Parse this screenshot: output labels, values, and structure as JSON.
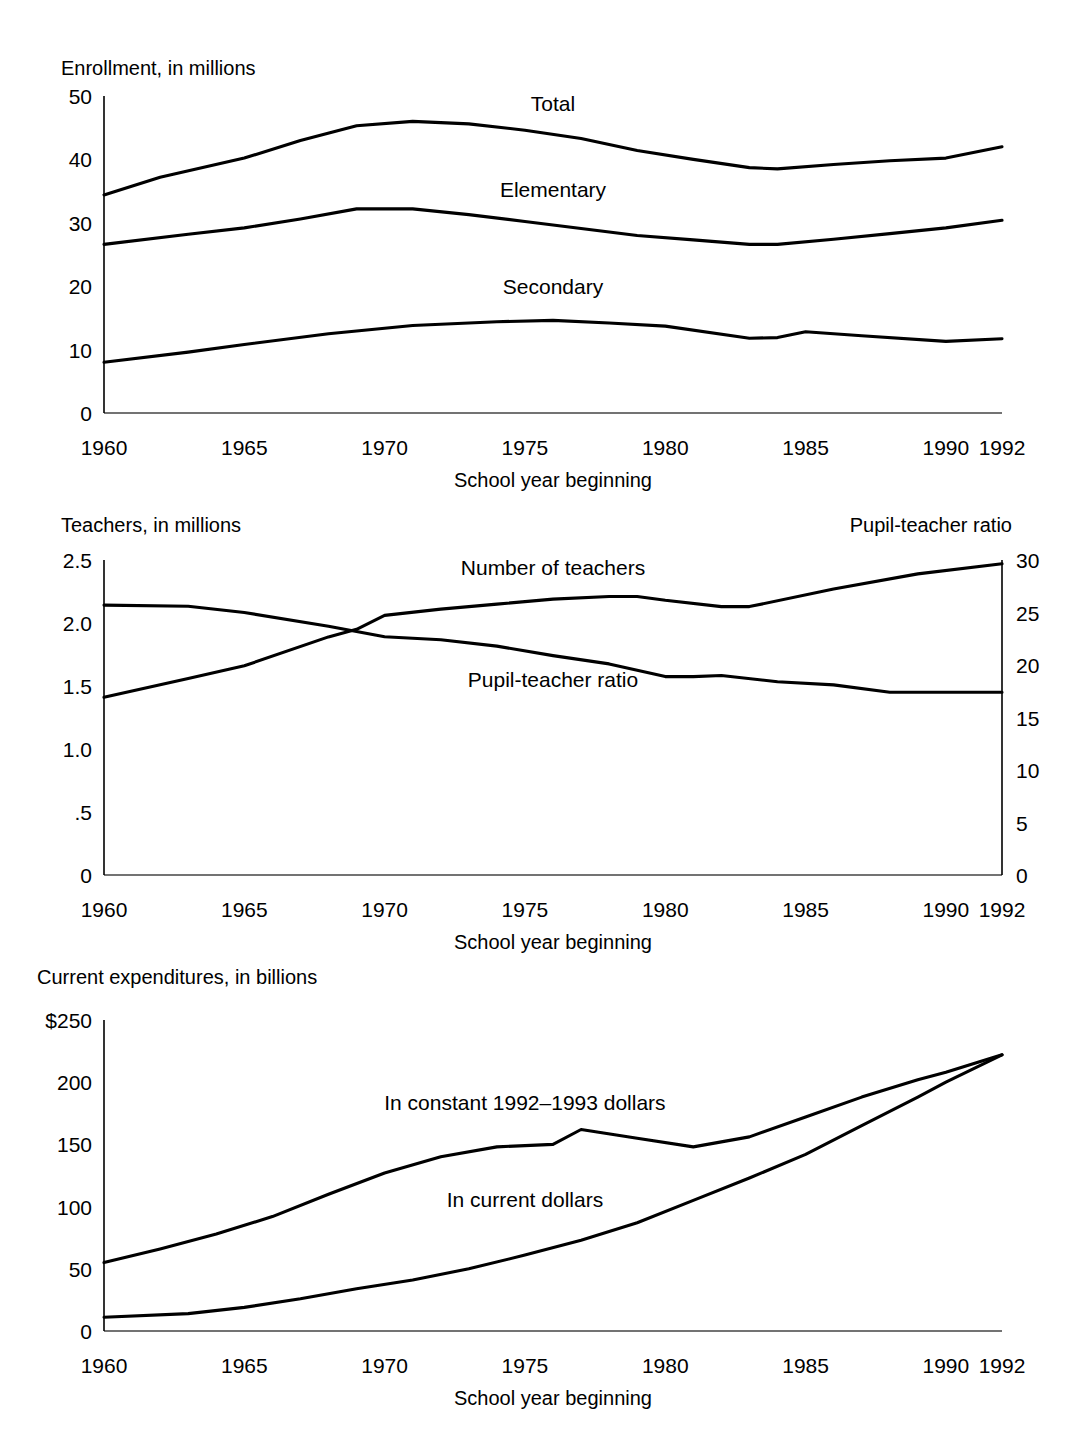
{
  "figure": {
    "background": "#ffffff",
    "line_color": "#000000",
    "axis_color": "#000000",
    "x_axis_title": "School year beginning",
    "x_ticks": [
      {
        "label": "1960",
        "year": 1960
      },
      {
        "label": "1965",
        "year": 1965
      },
      {
        "label": "1970",
        "year": 1970
      },
      {
        "label": "1975",
        "year": 1975
      },
      {
        "label": "1980",
        "year": 1980
      },
      {
        "label": "1985",
        "year": 1985
      },
      {
        "label": "1990",
        "year": 1990
      },
      {
        "label": "1992",
        "year": 1992
      }
    ]
  },
  "chart_data": [
    {
      "id": "enrollment",
      "type": "line",
      "title": "Enrollment, in millions",
      "ylabel": "Enrollment, in millions",
      "xlabel": "School year beginning",
      "grid": false,
      "legend": "inline-labels",
      "xlim": [
        1960,
        1992
      ],
      "ylim": [
        0,
        50
      ],
      "y_ticks": [
        0,
        10,
        20,
        30,
        40,
        50
      ],
      "y_tick_labels": [
        "0",
        "10",
        "20",
        "30",
        "40",
        "50"
      ],
      "x_ticks": [
        1960,
        1965,
        1970,
        1975,
        1980,
        1985,
        1990,
        1992
      ],
      "x_tick_labels": [
        "1960",
        "1965",
        "1970",
        "1975",
        "1980",
        "1985",
        "1990",
        "1992"
      ],
      "series": [
        {
          "name": "Total",
          "label_x": 1976,
          "label_y": 47.6,
          "x": [
            1960,
            1962,
            1965,
            1967,
            1969,
            1971,
            1973,
            1975,
            1977,
            1979,
            1981,
            1983,
            1984,
            1986,
            1988,
            1990,
            1992
          ],
          "values": [
            34.4,
            37.2,
            40.2,
            43.0,
            45.3,
            46.0,
            45.6,
            44.6,
            43.3,
            41.4,
            40.0,
            38.7,
            38.5,
            39.2,
            39.8,
            40.2,
            42.0
          ]
        },
        {
          "name": "Elementary",
          "label_x": 1976,
          "label_y": 34.0,
          "x": [
            1960,
            1963,
            1965,
            1967,
            1969,
            1971,
            1973,
            1975,
            1977,
            1979,
            1981,
            1983,
            1984,
            1986,
            1988,
            1990,
            1992
          ],
          "values": [
            26.6,
            28.2,
            29.2,
            30.6,
            32.2,
            32.2,
            31.3,
            30.2,
            29.1,
            28.0,
            27.3,
            26.6,
            26.6,
            27.4,
            28.3,
            29.2,
            30.4
          ]
        },
        {
          "name": "Secondary",
          "label_x": 1976,
          "label_y": 18.8,
          "x": [
            1960,
            1963,
            1965,
            1968,
            1971,
            1974,
            1976,
            1978,
            1980,
            1983,
            1984,
            1985,
            1987,
            1990,
            1992
          ],
          "values": [
            8.0,
            9.6,
            10.8,
            12.5,
            13.8,
            14.4,
            14.6,
            14.2,
            13.7,
            11.8,
            11.9,
            12.8,
            12.2,
            11.3,
            11.7
          ]
        }
      ]
    },
    {
      "id": "teachers",
      "type": "line",
      "title": "Teachers, in millions",
      "ylabel": "Teachers, in millions",
      "ylabel_right": "Pupil-teacher ratio",
      "xlabel": "School year beginning",
      "grid": false,
      "legend": "inline-labels",
      "xlim": [
        1960,
        1992
      ],
      "ylim": [
        0,
        2.5
      ],
      "ylim_right": [
        0,
        30
      ],
      "y_ticks": [
        0,
        0.5,
        1.0,
        1.5,
        2.0,
        2.5
      ],
      "y_tick_labels": [
        "0",
        ".5",
        "1.0",
        "1.5",
        "2.0",
        "2.5"
      ],
      "y_ticks_right": [
        0,
        5,
        10,
        15,
        20,
        25,
        30
      ],
      "y_tick_labels_right": [
        "0",
        "5",
        "10",
        "15",
        "20",
        "25",
        "30"
      ],
      "x_ticks": [
        1960,
        1965,
        1970,
        1975,
        1980,
        1985,
        1990,
        1992
      ],
      "x_tick_labels": [
        "1960",
        "1965",
        "1970",
        "1975",
        "1980",
        "1985",
        "1990",
        "1992"
      ],
      "series": [
        {
          "name": "Number of teachers",
          "axis": "left",
          "label_x": 1976,
          "label_y": 2.38,
          "x": [
            1960,
            1963,
            1965,
            1968,
            1969,
            1970,
            1972,
            1974,
            1976,
            1978,
            1979,
            1980,
            1982,
            1983,
            1986,
            1989,
            1992
          ],
          "values": [
            1.41,
            1.56,
            1.66,
            1.89,
            1.95,
            2.06,
            2.11,
            2.15,
            2.19,
            2.21,
            2.21,
            2.18,
            2.13,
            2.13,
            2.27,
            2.39,
            2.47
          ]
        },
        {
          "name": "Pupil-teacher ratio",
          "axis": "right",
          "label_x": 1976,
          "label_y": 17.9,
          "x": [
            1960,
            1963,
            1965,
            1968,
            1970,
            1972,
            1974,
            1976,
            1978,
            1980,
            1981,
            1982,
            1984,
            1986,
            1988,
            1990,
            1992
          ],
          "values": [
            25.7,
            25.6,
            25.0,
            23.7,
            22.7,
            22.4,
            21.8,
            20.9,
            20.1,
            18.9,
            18.9,
            19.0,
            18.4,
            18.1,
            17.4,
            17.4,
            17.4
          ]
        }
      ]
    },
    {
      "id": "expenditures",
      "type": "line",
      "title": "Current expenditures, in billions",
      "ylabel": "Current expenditures, in billions",
      "xlabel": "School year beginning",
      "grid": false,
      "legend": "inline-labels",
      "xlim": [
        1960,
        1992
      ],
      "ylim": [
        0,
        250
      ],
      "y_ticks": [
        0,
        50,
        100,
        150,
        200,
        250
      ],
      "y_tick_labels": [
        "0",
        "50",
        "100",
        "150",
        "200",
        "$250"
      ],
      "x_ticks": [
        1960,
        1965,
        1970,
        1975,
        1980,
        1985,
        1990,
        1992
      ],
      "x_tick_labels": [
        "1960",
        "1965",
        "1970",
        "1975",
        "1980",
        "1985",
        "1990",
        "1992"
      ],
      "series": [
        {
          "name": "In constant 1992–1993 dollars",
          "label_x": 1975,
          "label_y": 178,
          "x": [
            1960,
            1962,
            1964,
            1966,
            1968,
            1970,
            1972,
            1974,
            1976,
            1977,
            1979,
            1981,
            1983,
            1985,
            1987,
            1989,
            1990,
            1992
          ],
          "values": [
            55,
            66,
            78,
            92,
            110,
            127,
            140,
            148,
            150,
            162,
            155,
            148,
            156,
            172,
            188,
            202,
            208,
            222
          ]
        },
        {
          "name": "In current dollars",
          "label_x": 1975,
          "label_y": 100,
          "x": [
            1960,
            1963,
            1965,
            1967,
            1969,
            1971,
            1973,
            1975,
            1977,
            1979,
            1981,
            1983,
            1985,
            1987,
            1989,
            1990,
            1992
          ],
          "values": [
            11,
            14,
            19,
            26,
            34,
            41,
            50,
            61,
            73,
            87,
            105,
            123,
            142,
            165,
            188,
            200,
            222
          ]
        }
      ]
    }
  ]
}
